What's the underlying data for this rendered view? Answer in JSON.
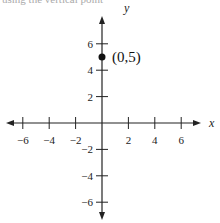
{
  "caption": "using the vertical point",
  "chart_data": {
    "type": "scatter",
    "title": "",
    "xlabel": "x",
    "ylabel": "y",
    "xlim": [
      -7,
      7
    ],
    "ylim": [
      -7,
      7
    ],
    "x_ticks": [
      -6,
      -4,
      -2,
      2,
      4,
      6
    ],
    "y_ticks": [
      -6,
      -4,
      -2,
      2,
      4,
      6
    ],
    "grid": false,
    "points": [
      {
        "x": 0,
        "y": 5,
        "label": "(0,5)"
      }
    ]
  },
  "colors": {
    "axis": "#222222",
    "point": "#111111"
  }
}
